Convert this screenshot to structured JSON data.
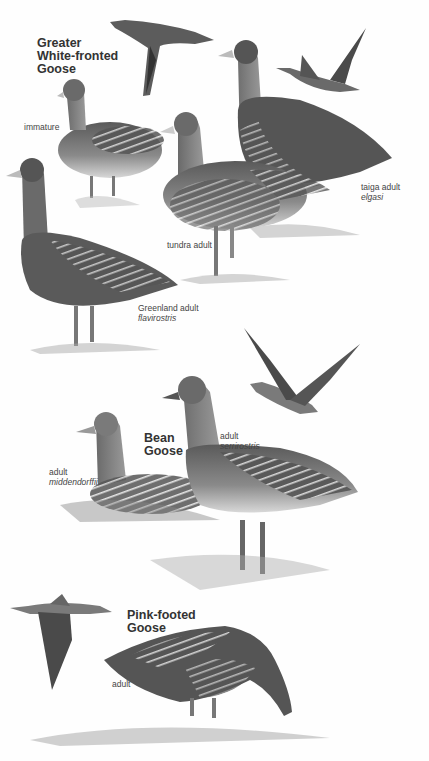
{
  "species": [
    {
      "name_line1": "Greater",
      "name_line2": "White-fronted",
      "name_line3": "Goose",
      "labels": [
        {
          "text": "immature",
          "sci": ""
        },
        {
          "text": "taiga adult",
          "sci": "elgasi"
        },
        {
          "text": "tundra adult",
          "sci": ""
        },
        {
          "text": "Greenland adult",
          "sci": "flavirostris"
        }
      ]
    },
    {
      "name_line1": "Bean",
      "name_line2": "Goose",
      "labels": [
        {
          "text": "adult",
          "sci": "middendorffii"
        },
        {
          "text": "adult",
          "sci": "serrirostris"
        }
      ]
    },
    {
      "name_line1": "Pink-footed",
      "name_line2": "Goose",
      "labels": [
        {
          "text": "adult",
          "sci": ""
        }
      ]
    }
  ],
  "palette": {
    "background": "#fefefe",
    "ink_dark": "#3a3a3a",
    "ink_mid": "#7a7a7a",
    "ink_light": "#c8c8c8"
  }
}
